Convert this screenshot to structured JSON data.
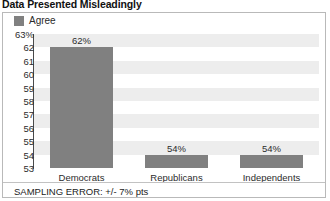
{
  "chart_data": {
    "type": "bar",
    "title": "Data Presented Misleadingly",
    "categories": [
      "Democrats",
      "Republicans",
      "Independents"
    ],
    "values": [
      62,
      54,
      54
    ],
    "value_labels": [
      "62%",
      "54%",
      "54%"
    ],
    "series": [
      {
        "name": "Agree",
        "values": [
          62,
          54,
          54
        ],
        "color": "#808080"
      }
    ],
    "legend": {
      "entries": [
        "Agree"
      ],
      "position": "top-left"
    },
    "xlabel": "",
    "ylabel": "",
    "ylim": [
      53,
      63
    ],
    "y_ticks": [
      63,
      62,
      61,
      60,
      59,
      58,
      57,
      56,
      55,
      54,
      53
    ],
    "y_tick_labels": [
      "63%",
      "62",
      "61",
      "60",
      "59",
      "58",
      "57",
      "56",
      "55",
      "54",
      "53"
    ],
    "grid": "alternating-horizontal-bands",
    "band_color": "#ededed",
    "plot_background": "#ffffff",
    "annotation": "SAMPLING ERROR: +/- 7% pts"
  },
  "title": {
    "text": "Data Presented Misleadingly"
  },
  "legend": {
    "swatch_color": "#808080",
    "label": "Agree"
  },
  "axis": {
    "y_labels": [
      "63%",
      "62",
      "61",
      "60",
      "59",
      "58",
      "57",
      "56",
      "55",
      "54",
      "53"
    ]
  },
  "bars": [
    {
      "category": "Democrats",
      "value_label": "62%"
    },
    {
      "category": "Republicans",
      "value_label": "54%"
    },
    {
      "category": "Independents",
      "value_label": "54%"
    }
  ],
  "footer": {
    "note": "SAMPLING ERROR: +/- 7% pts"
  }
}
